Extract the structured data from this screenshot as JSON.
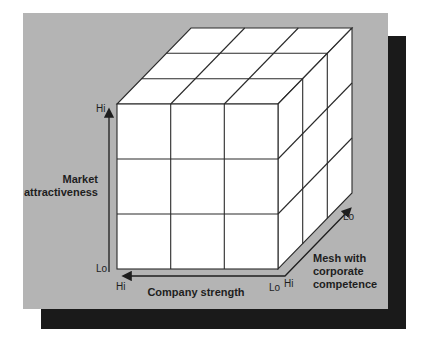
{
  "diagram": {
    "type": "3d-cube-matrix",
    "grid": "3x3x3",
    "axes": {
      "vertical": {
        "label_line1": "Market",
        "label_line2": "attractiveness",
        "hi": "Hi",
        "lo": "Lo"
      },
      "horizontal": {
        "label": "Company strength",
        "hi": "Hi",
        "lo": "Lo"
      },
      "depth": {
        "label_line1": "Mesh with",
        "label_line2": "corporate",
        "label_line3": "competence",
        "hi": "Hi",
        "lo": "Lo"
      }
    },
    "colors": {
      "panel": "#b4b4b4",
      "shadow": "#1a1a1a",
      "cube_face": "#ffffff",
      "line": "#2a2a2a"
    }
  }
}
